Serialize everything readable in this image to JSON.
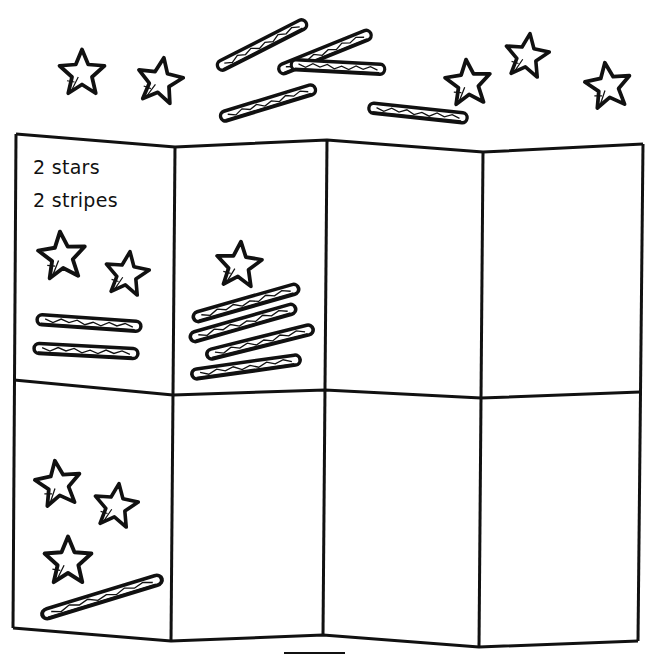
{
  "worksheet": {
    "panel_1": {
      "line_1": "2 stars",
      "line_2": "2 stripes",
      "stars": 2,
      "stripes": 2
    },
    "panel_2": {
      "stars": 1,
      "stripes": 4
    },
    "panel_3": {
      "stars": 0,
      "stripes": 0
    },
    "panel_4": {
      "stars": 0,
      "stripes": 0
    },
    "panel_5": {
      "stars": 3,
      "stripes": 1
    },
    "panel_6": {
      "stars": 0,
      "stripes": 0
    },
    "panel_7": {
      "stars": 0,
      "stripes": 0
    },
    "panel_8": {
      "stars": 0,
      "stripes": 0
    },
    "top_bank": {
      "stars": 6,
      "stripes": 5
    }
  },
  "colors": {
    "ink": "#111111",
    "paper": "#ffffff"
  }
}
